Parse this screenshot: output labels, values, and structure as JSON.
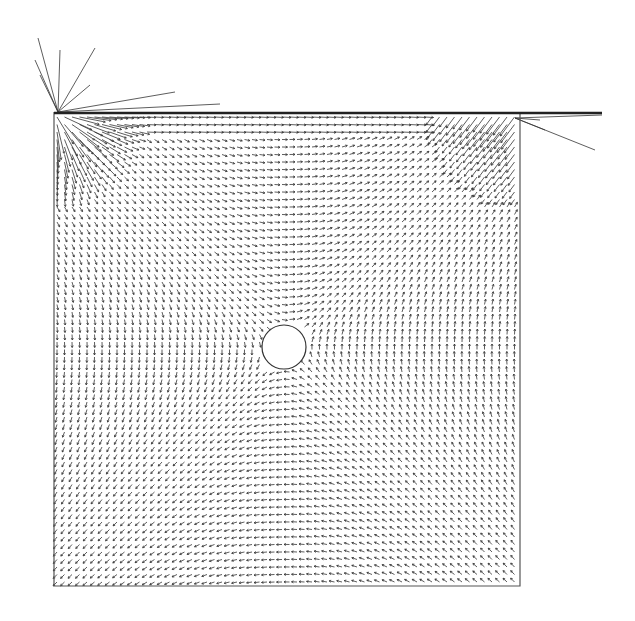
{
  "figure": {
    "type": "vector-field",
    "colors": {
      "background": "#ffffff",
      "arrow": "#333333",
      "border": "#555555"
    }
  },
  "domain_box": {
    "x0": 54,
    "y0": 112,
    "x1": 520,
    "y1": 586
  },
  "lid": {
    "y": 113,
    "x_end": 602
  },
  "obstacle": {
    "shape": "circle",
    "cx": 284,
    "cy": 347,
    "r": 22
  },
  "grid": {
    "spacing": 7.5
  }
}
